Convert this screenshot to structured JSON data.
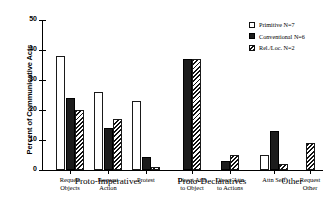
{
  "chart_data": {
    "type": "bar",
    "title": "",
    "xlabel": "",
    "ylabel": "Percent of Communicative Acts",
    "ylim": [
      0,
      50
    ],
    "yticks": [
      0,
      10,
      20,
      30,
      40,
      50
    ],
    "grid": false,
    "legend_position": "top-right",
    "categories": [
      "Request\nObjects",
      "Request\nAction",
      "Protest",
      "Direct Attn\nto Object",
      "Direct Attn\nto Actions",
      "Attn Self",
      "Request\nOther"
    ],
    "groups": [
      {
        "label": "Proto-Imperatives",
        "categories": [
          "Request\nObjects",
          "Request\nAction",
          "Protest"
        ]
      },
      {
        "label": "Proto-Declaratives",
        "categories": [
          "Direct Attn\nto Object",
          "Direct Attn\nto Actions"
        ]
      },
      {
        "label": "Other",
        "categories": [
          "Attn Self",
          "Request\nOther"
        ]
      }
    ],
    "series": [
      {
        "name": "Primitive N=7",
        "key": "primitive",
        "color": "#ffffff",
        "values": [
          38,
          26,
          23,
          0,
          0,
          5,
          0
        ]
      },
      {
        "name": "Conventional N=6",
        "key": "conventional",
        "color": "#1c1c1c",
        "values": [
          24,
          14,
          4.5,
          37,
          3,
          13,
          0
        ]
      },
      {
        "name": "Rel./Loc. N=2",
        "key": "relloc",
        "color": "#hatch",
        "values": [
          20,
          17,
          1,
          37,
          5,
          2,
          9
        ]
      }
    ]
  },
  "legend": {
    "items": [
      {
        "label": "Primitive N=7",
        "swatch": "primitive"
      },
      {
        "label": "Conventional N=6",
        "swatch": "conventional"
      },
      {
        "label": "Rel./Loc. N=2",
        "swatch": "relloc"
      }
    ]
  }
}
